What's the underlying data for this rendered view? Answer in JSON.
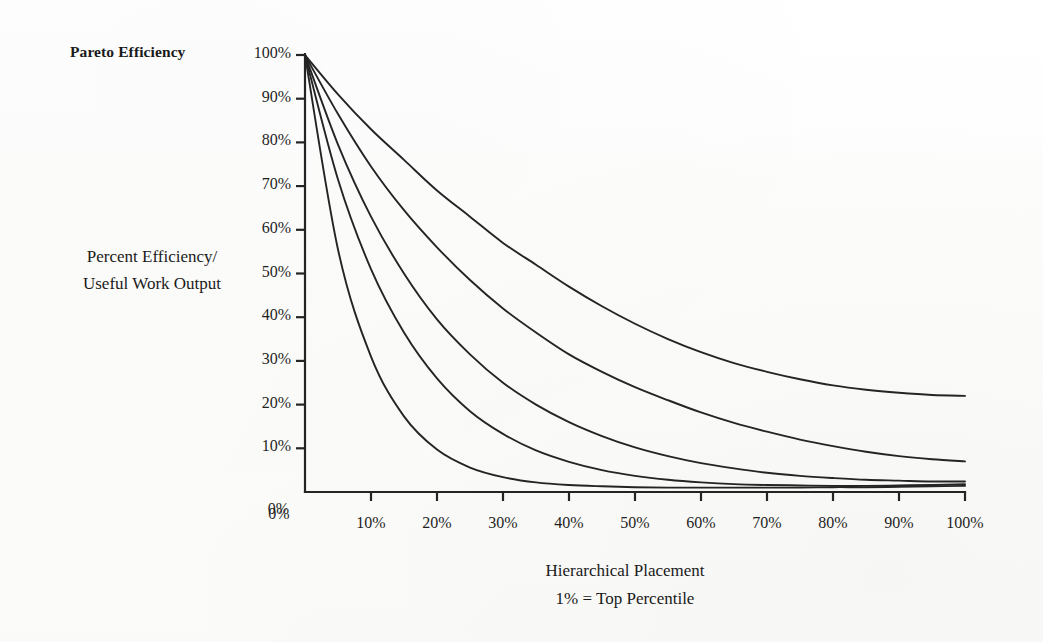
{
  "chart_data": {
    "type": "line",
    "title": "Pareto Efficiency",
    "ylabel_line1": "Percent Efficiency/",
    "ylabel_line2": "Useful Work Output",
    "xlabel_line1": "Hierarchical Placement",
    "xlabel_line2": "1% = Top Percentile",
    "xlim": [
      0,
      100
    ],
    "ylim": [
      0,
      100
    ],
    "grid": false,
    "legend": "none",
    "line_color": "#242424",
    "x_tick_labels": [
      "0%",
      "10%",
      "20%",
      "30%",
      "40%",
      "50%",
      "60%",
      "70%",
      "80%",
      "90%",
      "100%"
    ],
    "x_ticks": [
      0,
      10,
      20,
      30,
      40,
      50,
      60,
      70,
      80,
      90,
      100
    ],
    "y_tick_labels": [
      "100%",
      "90%",
      "80%",
      "70%",
      "60%",
      "50%",
      "40%",
      "30%",
      "20%",
      "10%",
      "0%"
    ],
    "y_ticks": [
      100,
      90,
      80,
      70,
      60,
      50,
      40,
      30,
      20,
      10,
      0
    ],
    "x": [
      0,
      5,
      10,
      15,
      20,
      25,
      30,
      35,
      40,
      45,
      50,
      55,
      60,
      65,
      70,
      75,
      80,
      85,
      90,
      95,
      100
    ],
    "series": [
      {
        "name": "curve-1-shallowest",
        "values": [
          100,
          91,
          83,
          76,
          69,
          63,
          57,
          52,
          47,
          42.5,
          38.5,
          35,
          32,
          29.5,
          27.5,
          25.8,
          24.4,
          23.4,
          22.7,
          22.2,
          22.0
        ]
      },
      {
        "name": "curve-2",
        "values": [
          100,
          86.5,
          74.5,
          64.5,
          56,
          48.5,
          42,
          36.5,
          31.5,
          27.5,
          24,
          21,
          18.2,
          15.8,
          13.8,
          12,
          10.5,
          9.2,
          8.2,
          7.5,
          7.0
        ]
      },
      {
        "name": "curve-3-middle",
        "values": [
          100,
          79.5,
          63,
          50,
          39.5,
          31.5,
          25,
          20,
          16,
          12.8,
          10.2,
          8.2,
          6.6,
          5.4,
          4.4,
          3.7,
          3.2,
          2.8,
          2.6,
          2.4,
          2.4
        ]
      },
      {
        "name": "curve-4",
        "values": [
          100,
          71.5,
          51,
          36.5,
          26,
          18.5,
          13.3,
          9.5,
          6.9,
          5.0,
          3.7,
          2.8,
          2.2,
          1.8,
          1.6,
          1.5,
          1.4,
          1.4,
          1.5,
          1.6,
          1.8
        ]
      },
      {
        "name": "curve-5-steepest",
        "values": [
          100,
          55.5,
          31,
          17.3,
          9.7,
          5.6,
          3.4,
          2.2,
          1.6,
          1.3,
          1.1,
          1.0,
          1.0,
          1.0,
          1.0,
          1.0,
          1.1,
          1.1,
          1.2,
          1.3,
          1.4
        ]
      }
    ]
  }
}
